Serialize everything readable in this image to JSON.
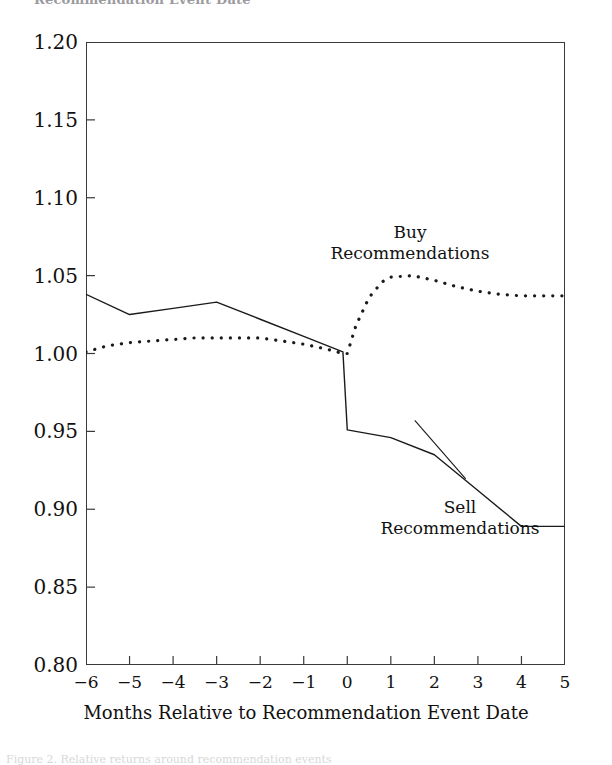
{
  "page": {
    "top_fragment": "Recommendation Event Date",
    "bottom_fragment": "Figure 2. Relative returns around recommendation events"
  },
  "chart_data": {
    "type": "line",
    "title": "",
    "subtitle": "",
    "xlabel": "Months Relative to Recommendation Event Date",
    "ylabel": "",
    "xlim": [
      -6,
      5
    ],
    "ylim": [
      0.8,
      1.2
    ],
    "grid": false,
    "legend_position": "inline-annotation",
    "xticks": [
      "−6",
      "−5",
      "−4",
      "−3",
      "−2",
      "−1",
      "0",
      "1",
      "2",
      "3",
      "4",
      "5"
    ],
    "xtick_values": [
      -6,
      -5,
      -4,
      -3,
      -2,
      -1,
      0,
      1,
      2,
      3,
      4,
      5
    ],
    "yticks": [
      "1.20",
      "1.15",
      "1.10",
      "1.05",
      "1.00",
      "0.95",
      "0.90",
      "0.85",
      "0.80"
    ],
    "ytick_values": [
      1.2,
      1.15,
      1.1,
      1.05,
      1.0,
      0.95,
      0.9,
      0.85,
      0.8
    ],
    "series": [
      {
        "name": "Buy Recommendations",
        "label_lines": [
          "Buy",
          "Recommendations"
        ],
        "style": "dotted",
        "color": "#1a1a1a",
        "x": [
          -6,
          -5.5,
          -5,
          -4.5,
          -4,
          -3.5,
          -3,
          -2.5,
          -2,
          -1.5,
          -1,
          -0.5,
          -0.1,
          0,
          0.2,
          0.5,
          0.8,
          1,
          1.5,
          2,
          2.5,
          3,
          3.5,
          4,
          4.5,
          5
        ],
        "values": [
          1.001,
          1.005,
          1.007,
          1.008,
          1.009,
          1.01,
          1.01,
          1.01,
          1.01,
          1.008,
          1.006,
          1.003,
          1.0,
          1.0,
          1.018,
          1.036,
          1.046,
          1.049,
          1.05,
          1.047,
          1.043,
          1.04,
          1.038,
          1.037,
          1.037,
          1.037
        ]
      },
      {
        "name": "Sell Recommendations",
        "label_lines": [
          "Sell",
          "Recommendations"
        ],
        "style": "solid",
        "color": "#1a1a1a",
        "x": [
          -6,
          -5,
          -4,
          -3,
          -2,
          -1,
          -0.1,
          0,
          1,
          2,
          3,
          4,
          5
        ],
        "values": [
          1.038,
          1.025,
          1.029,
          1.033,
          1.022,
          1.011,
          1.001,
          0.951,
          0.946,
          0.935,
          0.912,
          0.889,
          0.889
        ]
      }
    ],
    "annotations": [
      {
        "text": "Buy Recommendations",
        "x": 1.0,
        "y": 1.075
      },
      {
        "text": "Sell Recommendations",
        "x": 2.6,
        "y": 0.905
      }
    ]
  }
}
